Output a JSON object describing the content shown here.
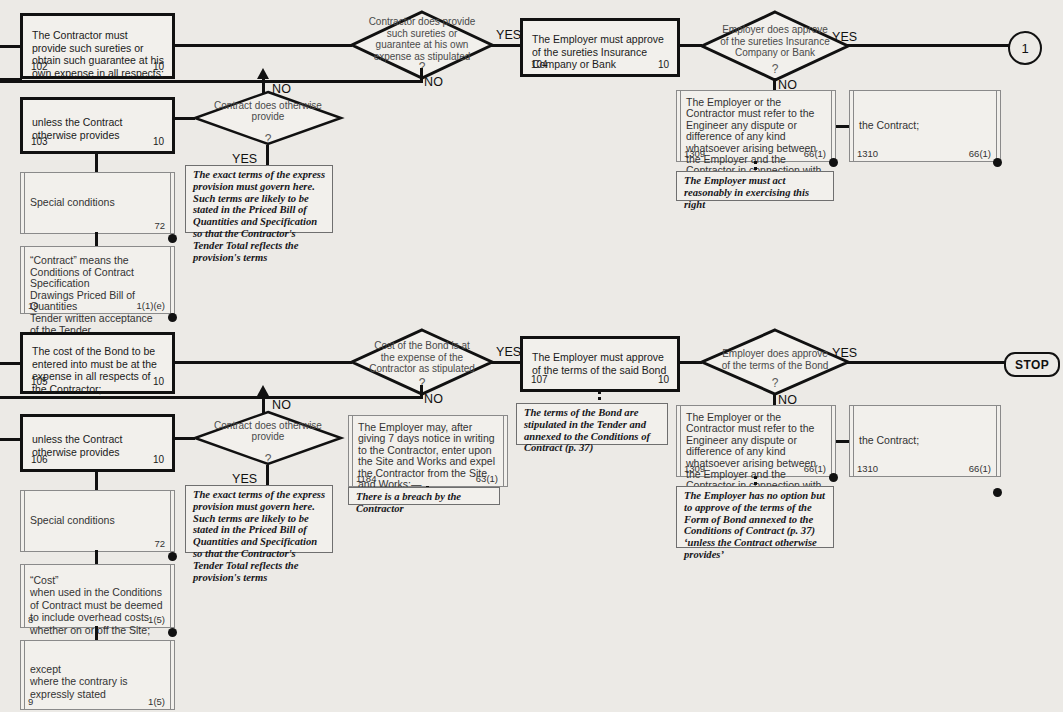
{
  "meta": {
    "colors": {
      "ink": "#111111",
      "paper": "#eceae6",
      "box_fill": "#f2f0ec",
      "light_rule": "#8a8a8a"
    }
  },
  "labels": {
    "yes": "YES",
    "no": "NO",
    "question": "?"
  },
  "terminators": {
    "circle_one": "1",
    "stop": "STOP"
  },
  "row1": {
    "box_102": {
      "text": "The Contractor must provide such sureties or obtain such guarantee at his own expense in all respects;",
      "number": "102",
      "ref": "10"
    },
    "box_103": {
      "text": "unless the Contract otherwise provides",
      "number": "103",
      "ref": "10"
    },
    "diamond_sureties": {
      "text": "Contractor does provide such sureties or guarantee at his own expense as stipulated"
    },
    "diamond_otherwise_1": {
      "text": "Contract does otherwise provide"
    },
    "box_104": {
      "text": "The Employer must approve of the sureties Insurance Company or Bank",
      "number": "104",
      "ref": "10"
    },
    "diamond_employer_approve": {
      "text": "Employer does approve of the sureties Insurance Company or Bank"
    },
    "box_1309": {
      "text": "The Employer or the Contractor must refer to the Engineer any dispute or difference of any kind whatsoever arising between the Employer and the Contractor in connection with or arising out of:—",
      "number": "1309",
      "ref": "66(1)"
    },
    "box_1310": {
      "text": "the Contract;",
      "number": "1310",
      "ref": "66(1)"
    },
    "note_reasonably": "The Employer must act reasonably in exercising this right",
    "note_express_provision": "The exact terms of the express provision must govern here. Such terms are likely to be stated in the Priced Bill of Quantities and Specification so that the Contractor's Tender Total reflects the provision's terms",
    "box_special_conditions": {
      "text": "Special conditions",
      "number": "",
      "ref": "72"
    },
    "box_contract_means": {
      "text": "“Contract” means the\nConditions of Contract  Specification\nDrawings  Priced Bill of Quantities\nTender  written acceptance of the Tender\nContract Agreement (if completed)",
      "number": "19",
      "ref": "1(1)(e)"
    }
  },
  "row2": {
    "box_105": {
      "text": "The cost of the Bond to be entered into must be at the expense in all respects of the Contractor;",
      "number": "105",
      "ref": "10"
    },
    "box_106": {
      "text": "unless the Contract otherwise provides",
      "number": "106",
      "ref": "10"
    },
    "diamond_bond_cost": {
      "text": "Cost of the Bond is at the expense of the Contractor as stipulated"
    },
    "diamond_otherwise_2": {
      "text": "Contract does otherwise provide"
    },
    "box_107": {
      "text": "The Employer must approve of the terms of the said Bond",
      "number": "107",
      "ref": "10"
    },
    "diamond_employer_terms": {
      "text": "Employer does approve of the terms of the Bond"
    },
    "box_1184": {
      "text": "The Employer may, after giving 7 days notice in writing to the Contractor, enter upon the Site and Works and expel the Contractor from the Site and Works:—",
      "number": "1184",
      "ref": "63(1)"
    },
    "box_1309b": {
      "text": "The Employer or the Contractor must refer to the Engineer any dispute or difference of any kind whatsoever arising between the Employer and the Contractor in connection with or arising out of:—",
      "number": "1309",
      "ref": "66(1)"
    },
    "box_1310b": {
      "text": "the Contract;",
      "number": "1310",
      "ref": "66(1)"
    },
    "note_breach": "There is a breach by the Contractor",
    "note_bond_terms": "The terms of the Bond are stipulated in the Tender and annexed to the Conditions of Contract (p. 37)",
    "note_no_option": "The Employer has no option but to approve of the terms of the Form of Bond annexed to the Conditions of Contract (p. 37) ‘unless the Contract otherwise provides’",
    "note_express_provision_2": "The exact terms of the express provision must govern here. Such terms are likely to be stated in the Priced Bill of Quantities and Specification so that the Contractor's Tender Total reflects the provision's terms",
    "box_special_conditions_2": {
      "text": "Special conditions",
      "number": "",
      "ref": "72"
    },
    "box_cost_def": {
      "text": "“Cost”\nwhen used in the Conditions of Contract must be deemed to include overhead costs whether on or off the Site;",
      "number": "8",
      "ref": "1(5)"
    },
    "box_except": {
      "text": "except\nwhere the contrary is expressly stated",
      "number": "9",
      "ref": "1(5)"
    }
  }
}
